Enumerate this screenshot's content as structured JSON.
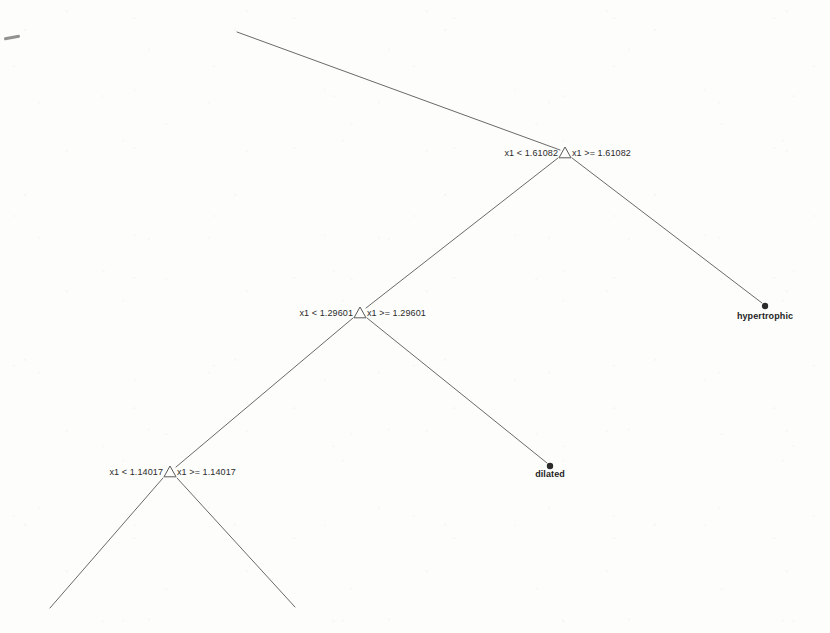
{
  "figure": {
    "type": "decision-tree",
    "corner_mark": "stray-pen-mark",
    "background_color": "#fdfdfc",
    "line_color": "#5a5a5a",
    "text_color": "#2b2b2b"
  },
  "tree": {
    "variable": "x1",
    "nodes": [
      {
        "id": "node-1",
        "x": 565,
        "y": 153,
        "split_variable": "x1",
        "threshold": "1.61082",
        "left_label": "x1 < 1.61082",
        "right_label": "x1 >= 1.61082",
        "left_label_x": 558,
        "right_label_x": 572,
        "label_y": 153
      },
      {
        "id": "node-2",
        "x": 360,
        "y": 313,
        "split_variable": "x1",
        "threshold": "1.29601",
        "left_label": "x1 < 1.29601",
        "right_label": "x1 >= 1.29601",
        "left_label_x": 353,
        "right_label_x": 367,
        "label_y": 313
      },
      {
        "id": "node-3",
        "x": 170,
        "y": 472,
        "split_variable": "x1",
        "threshold": "1.14017",
        "left_label": "x1 < 1.14017",
        "right_label": "x1 >= 1.14017",
        "left_label_x": 163,
        "right_label_x": 177,
        "label_y": 472
      }
    ],
    "leaves": [
      {
        "id": "leaf-hypertrophic",
        "label": "hypertrophic",
        "x": 765,
        "y": 306,
        "label_x": 765,
        "label_y": 312
      },
      {
        "id": "leaf-dilated",
        "label": "dilated",
        "x": 550,
        "y": 466,
        "label_x": 550,
        "label_y": 470
      }
    ],
    "edges": [
      {
        "id": "edge-root-incoming",
        "x1": 237,
        "y1": 32,
        "x2": 560,
        "y2": 150,
        "note": "incoming branch from off-canvas parent"
      },
      {
        "id": "edge-n1-right",
        "x1": 572,
        "y1": 158,
        "x2": 762,
        "y2": 303,
        "note": "to hypertrophic leaf"
      },
      {
        "id": "edge-n1-left",
        "x1": 558,
        "y1": 158,
        "x2": 366,
        "y2": 308,
        "note": "to node-2"
      },
      {
        "id": "edge-n2-right",
        "x1": 367,
        "y1": 318,
        "x2": 547,
        "y2": 463,
        "note": "to dilated leaf"
      },
      {
        "id": "edge-n2-left",
        "x1": 353,
        "y1": 318,
        "x2": 176,
        "y2": 467,
        "note": "to node-3"
      },
      {
        "id": "edge-n3-left",
        "x1": 163,
        "y1": 478,
        "x2": 50,
        "y2": 608,
        "note": "branch continues off canvas"
      },
      {
        "id": "edge-n3-right",
        "x1": 177,
        "y1": 478,
        "x2": 295,
        "y2": 607,
        "note": "branch continues off canvas"
      }
    ]
  }
}
